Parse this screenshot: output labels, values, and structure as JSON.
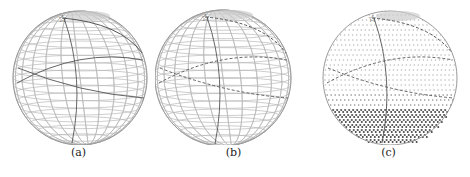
{
  "figure": {
    "panels": [
      {
        "label": "(a)",
        "cx": 80,
        "cy": 78,
        "r": 67,
        "style": "wire",
        "bottom_dense": false
      },
      {
        "label": "(b)",
        "cx": 68,
        "cy": 78,
        "r": 68,
        "style": "wire",
        "bottom_dense": false
      },
      {
        "label": "(c)",
        "cx": 80,
        "cy": 78,
        "r": 67,
        "style": "dots",
        "bottom_dense": true
      }
    ],
    "colors": {
      "grid": "#b8b8b8",
      "path": "#555555",
      "star": "#333333"
    }
  }
}
